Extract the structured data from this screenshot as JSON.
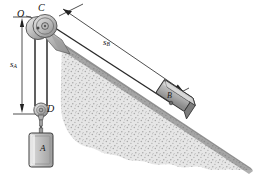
{
  "figure": {
    "type": "mechanics-diagram",
    "width": 258,
    "height": 183
  },
  "labels": {
    "pivot_O": "O",
    "pulley_C": "C",
    "pulley_D": "D",
    "block_A": "A",
    "block_B": "B",
    "dim_sA_base": "s",
    "dim_sA_sub": "A",
    "dim_sB_base": "s",
    "dim_sB_sub": "B"
  },
  "colors": {
    "ink": "#1a1a1a",
    "incline_fill": "#e2e2e2",
    "incline_edge": "#9a9a9a",
    "pulley_light": "#dcdcdc",
    "pulley_mid": "#b4b4b4",
    "pulley_dark": "#7e7e7e",
    "block_fill": "#c4c4c4",
    "block_shade": "#8f8f8f",
    "stipple": "#a6a6a6",
    "cable": "#2b2b2b"
  },
  "elements": {
    "fixed_pulley_label": "fixed pulley at C",
    "movable_pulley_label": "movable pulley D",
    "hanging_block_label": "block A suspended from movable pulley",
    "incline_block_label": "block B resting on inclined surface",
    "ground_label": "inclined stippled ground",
    "cable_label": "inextensible cable",
    "dim_sA_label": "vertical distance s_A from O to D",
    "dim_sB_label": "distance s_B along incline to block B"
  }
}
